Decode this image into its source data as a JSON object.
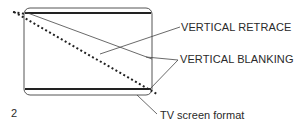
{
  "figure": {
    "number": "2",
    "caption": "TV screen format"
  },
  "labels": {
    "retrace": "VERTICAL RETRACE",
    "blanking": "VERTICAL BLANKING"
  },
  "colors": {
    "ink": "#2a2a2a",
    "background": "#ffffff"
  }
}
